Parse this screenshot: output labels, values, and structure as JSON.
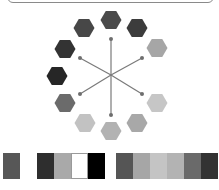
{
  "diagram": {
    "title": "",
    "center": {
      "x": 111,
      "y": 75
    },
    "hexagon_radius": 10.5,
    "hexagons": [
      {
        "name": "hex-top",
        "x": 111,
        "y": 20,
        "color": "#4a4a4a"
      },
      {
        "name": "hex-top-right",
        "x": 137,
        "y": 28,
        "color": "#3c3c3c"
      },
      {
        "name": "hex-right-upper",
        "x": 157,
        "y": 48,
        "color": "#a6a6a6"
      },
      {
        "name": "hex-right-lower",
        "x": 157,
        "y": 103,
        "color": "#c6c6c6"
      },
      {
        "name": "hex-bottom-right",
        "x": 137,
        "y": 123,
        "color": "#a8a8a8"
      },
      {
        "name": "hex-bottom",
        "x": 111,
        "y": 131,
        "color": "#b2b2b2"
      },
      {
        "name": "hex-bottom-left",
        "x": 85,
        "y": 123,
        "color": "#c2c2c2"
      },
      {
        "name": "hex-left-lower",
        "x": 65,
        "y": 103,
        "color": "#6b6b6b"
      },
      {
        "name": "hex-left",
        "x": 57,
        "y": 76,
        "color": "#262626"
      },
      {
        "name": "hex-left-upper",
        "x": 65,
        "y": 49,
        "color": "#333333"
      },
      {
        "name": "hex-top-left",
        "x": 84,
        "y": 28,
        "color": "#474747"
      }
    ],
    "spokes": [
      {
        "x": 111,
        "y": 39
      },
      {
        "x": 142,
        "y": 58
      },
      {
        "x": 142,
        "y": 94
      },
      {
        "x": 111,
        "y": 115
      },
      {
        "x": 80,
        "y": 94
      },
      {
        "x": 80,
        "y": 58
      }
    ],
    "spoke_color": "#7a7a7a",
    "dot_color": "#6e6e6e"
  },
  "swatches": {
    "left": [
      {
        "color": "#575757",
        "width": 17
      },
      {
        "color": "#ffffff",
        "width": 17,
        "borderless": true
      },
      {
        "color": "#2e2e2e",
        "width": 17
      },
      {
        "color": "#a9a9a9",
        "width": 17
      },
      {
        "color": "#ffffff",
        "width": 17,
        "outlined": true
      },
      {
        "color": "#000000",
        "width": 17
      }
    ],
    "right": [
      {
        "color": "#555555",
        "width": 17
      },
      {
        "color": "#a6a6a6",
        "width": 17
      },
      {
        "color": "#c4c4c4",
        "width": 17
      },
      {
        "color": "#b3b3b3",
        "width": 17
      },
      {
        "color": "#6a6a6a",
        "width": 17
      },
      {
        "color": "#333333",
        "width": 17
      }
    ]
  }
}
